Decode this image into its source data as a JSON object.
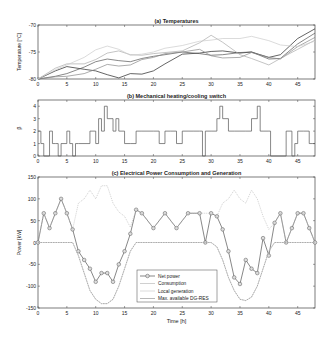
{
  "chart_data": [
    {
      "type": "line",
      "title": "(a) Temperatures",
      "xlabel": "",
      "ylabel": "Temperature [°C]",
      "xlim": [
        0,
        48
      ],
      "ylim": [
        -80,
        -70
      ],
      "xticks": [
        0,
        5,
        10,
        15,
        20,
        25,
        30,
        35,
        40,
        45
      ],
      "yticks": [
        -80,
        -75,
        -70
      ],
      "grid": false,
      "x": [
        0,
        3,
        5,
        8,
        10,
        12,
        14,
        16,
        18,
        20,
        22,
        25,
        28,
        30,
        32,
        35,
        37,
        40,
        42,
        45,
        48
      ],
      "series": [
        {
          "name": "T1",
          "color": "#222222",
          "values": [
            -80,
            -78.5,
            -77.7,
            -78.2,
            -78.5,
            -79.2,
            -79.8,
            -79,
            -79.1,
            -78.5,
            -77.2,
            -75.4,
            -75.2,
            -74.9,
            -74.8,
            -75.2,
            -75,
            -76,
            -75.5,
            -72.5,
            -70.7
          ]
        },
        {
          "name": "T2",
          "color": "#555555",
          "values": [
            -80,
            -79.5,
            -79,
            -77.8,
            -76.8,
            -76.3,
            -76.6,
            -76.8,
            -76.2,
            -75.8,
            -75.5,
            -75,
            -75.3,
            -75.6,
            -75.5,
            -75.1,
            -75,
            -76.3,
            -76.2,
            -73.5,
            -71.5
          ]
        },
        {
          "name": "T3",
          "color": "#888888",
          "values": [
            -80,
            -79.6,
            -79.5,
            -79,
            -78.2,
            -77.3,
            -77.6,
            -77.4,
            -76.4,
            -76,
            -75.3,
            -75,
            -74.5,
            -75.7,
            -76.1,
            -76,
            -75.1,
            -76,
            -76.3,
            -74,
            -72.3
          ]
        },
        {
          "name": "T4",
          "color": "#aaaaaa",
          "values": [
            -80,
            -78,
            -77.2,
            -77.2,
            -76.4,
            -75.2,
            -74.8,
            -75.5,
            -75.6,
            -75.3,
            -75.1,
            -74.8,
            -73.3,
            -71.9,
            -73.2,
            -75.5,
            -76.2,
            -77.4,
            -76.2,
            -74.5,
            -72.8
          ]
        },
        {
          "name": "T5",
          "color": "#cccccc",
          "values": [
            -80,
            -78.3,
            -77.4,
            -76,
            -74.6,
            -73.9,
            -74.5,
            -75.6,
            -75.4,
            -75,
            -74.3,
            -73.8,
            -73,
            -72.8,
            -72.5,
            -72.5,
            -72.1,
            -72.9,
            -73.7,
            -74,
            -73
          ]
        }
      ]
    },
    {
      "type": "line",
      "title": "(b) Mechanical heating/cooling switch",
      "xlabel": "",
      "ylabel": "β",
      "xlim": [
        0,
        48
      ],
      "ylim": [
        0,
        4.5
      ],
      "xticks": [
        0,
        5,
        10,
        15,
        20,
        25,
        30,
        35,
        40,
        45
      ],
      "yticks": [
        0,
        1,
        2,
        3,
        4
      ],
      "grid": false,
      "step": true,
      "x": [
        0,
        0.5,
        1,
        2,
        2.5,
        3,
        3.5,
        4,
        5,
        5.5,
        6,
        6.5,
        7,
        9,
        10,
        10.5,
        11,
        11.5,
        12,
        13,
        13.5,
        14,
        15,
        16,
        17,
        17.5,
        18,
        20,
        21,
        22,
        23,
        24,
        25,
        26,
        27,
        28,
        28.5,
        29,
        30,
        31,
        31.5,
        32,
        33,
        34,
        35,
        36,
        37,
        38,
        38.5,
        39,
        40,
        40.3,
        43,
        44,
        44.5,
        45,
        46,
        47,
        47.5
      ],
      "series": [
        {
          "name": "β",
          "color": "#555555",
          "values": [
            2,
            1,
            0,
            2,
            1,
            1,
            0,
            1,
            2,
            1,
            0,
            1,
            1,
            2,
            1,
            3,
            2,
            4,
            3,
            2,
            3,
            2,
            1,
            1,
            2,
            2,
            2,
            2,
            1,
            2,
            2,
            1,
            2,
            2,
            2,
            2,
            0,
            2,
            2,
            3,
            4,
            3,
            2,
            2,
            2,
            2,
            3,
            4,
            2,
            2,
            2,
            0,
            2,
            0,
            1,
            2,
            2,
            1,
            1
          ]
        }
      ]
    },
    {
      "type": "line",
      "title": "(c) Electrical Power Consumption and Generation",
      "xlabel": "Time [h]",
      "ylabel": "Power [kW]",
      "xlim": [
        0,
        48
      ],
      "ylim": [
        -150,
        150
      ],
      "xticks": [
        0,
        5,
        10,
        15,
        20,
        25,
        30,
        35,
        40,
        45
      ],
      "yticks": [
        -150,
        -100,
        -50,
        0,
        50,
        100,
        150
      ],
      "grid": false,
      "legend_position": "lower center",
      "legend": [
        "Net power",
        "Consumption",
        "Local generation",
        "Max. available DG-RES"
      ],
      "x": [
        0,
        1,
        2,
        3,
        4,
        5,
        6,
        7,
        8,
        9,
        10,
        11,
        12,
        13,
        14,
        15,
        16,
        17,
        18,
        20,
        22,
        24,
        26,
        28,
        29,
        30,
        31,
        32,
        33,
        34,
        35,
        36,
        37,
        38,
        39,
        40,
        41,
        42,
        43,
        44,
        45,
        46,
        47,
        48
      ],
      "series": [
        {
          "name": "Net power",
          "color": "#555555",
          "marker": "o",
          "values": [
            0,
            67,
            33,
            67,
            100,
            67,
            30,
            -20,
            -40,
            -60,
            -90,
            -70,
            -70,
            -90,
            -50,
            -20,
            20,
            75,
            67,
            33,
            67,
            33,
            67,
            67,
            0,
            67,
            60,
            30,
            -20,
            -80,
            -95,
            -40,
            -60,
            -70,
            10,
            -30,
            45,
            67,
            0,
            33,
            67,
            67,
            33,
            0
          ]
        },
        {
          "name": "Consumption",
          "color": "#bbbbbb",
          "values": [
            0,
            67,
            33,
            67,
            100,
            67,
            30,
            90,
            100,
            120,
            100,
            130,
            130,
            90,
            70,
            60,
            35,
            75,
            67,
            33,
            67,
            33,
            67,
            67,
            67,
            67,
            60,
            90,
            100,
            120,
            100,
            90,
            120,
            100,
            60,
            30,
            45,
            67,
            0,
            33,
            67,
            67,
            33,
            0
          ]
        },
        {
          "name": "Local generation",
          "color": "#cccccc",
          "values": [
            0,
            0,
            0,
            0,
            0,
            0,
            0,
            -30,
            -70,
            -110,
            -130,
            -140,
            -140,
            -130,
            -100,
            -60,
            -20,
            0,
            0,
            0,
            0,
            0,
            0,
            0,
            0,
            0,
            -10,
            -40,
            -80,
            -110,
            -130,
            -133,
            -125,
            -100,
            -60,
            -20,
            0,
            0,
            0,
            0,
            0,
            0,
            0,
            0
          ]
        },
        {
          "name": "Max. available DG-RES",
          "color": "#999999",
          "values": [
            0,
            0,
            0,
            0,
            0,
            0,
            0,
            -30,
            -70,
            -110,
            -130,
            -140,
            -140,
            -130,
            -100,
            -60,
            -20,
            0,
            0,
            0,
            0,
            0,
            0,
            0,
            0,
            0,
            -10,
            -40,
            -80,
            -110,
            -130,
            -133,
            -125,
            -100,
            -60,
            -20,
            0,
            0,
            0,
            0,
            0,
            0,
            0,
            0
          ]
        }
      ]
    }
  ]
}
